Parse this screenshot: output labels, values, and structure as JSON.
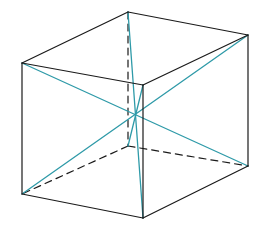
{
  "diagram": {
    "type": "cube-space-diagonals",
    "colors": {
      "edge": "#1a1a1a",
      "diagonal": "#2e9aa8",
      "background": "#ffffff"
    },
    "vertices": {
      "A": [
        22,
        63
      ],
      "B": [
        143,
        85
      ],
      "C": [
        143,
        218
      ],
      "D": [
        22,
        194
      ],
      "E": [
        128,
        12
      ],
      "F": [
        248,
        35
      ],
      "G": [
        248,
        166
      ],
      "H": [
        128,
        146
      ]
    },
    "visible_edges": [
      [
        "A",
        "B"
      ],
      [
        "B",
        "C"
      ],
      [
        "C",
        "D"
      ],
      [
        "D",
        "A"
      ],
      [
        "A",
        "E"
      ],
      [
        "E",
        "F"
      ],
      [
        "F",
        "B"
      ],
      [
        "F",
        "G"
      ],
      [
        "G",
        "C"
      ]
    ],
    "hidden_edges": [
      [
        "E",
        "H"
      ],
      [
        "H",
        "D"
      ],
      [
        "H",
        "G"
      ]
    ],
    "diagonals": [
      [
        "A",
        "G"
      ],
      [
        "F",
        "D"
      ],
      [
        "E",
        "C"
      ],
      [
        "B",
        "H"
      ]
    ]
  }
}
